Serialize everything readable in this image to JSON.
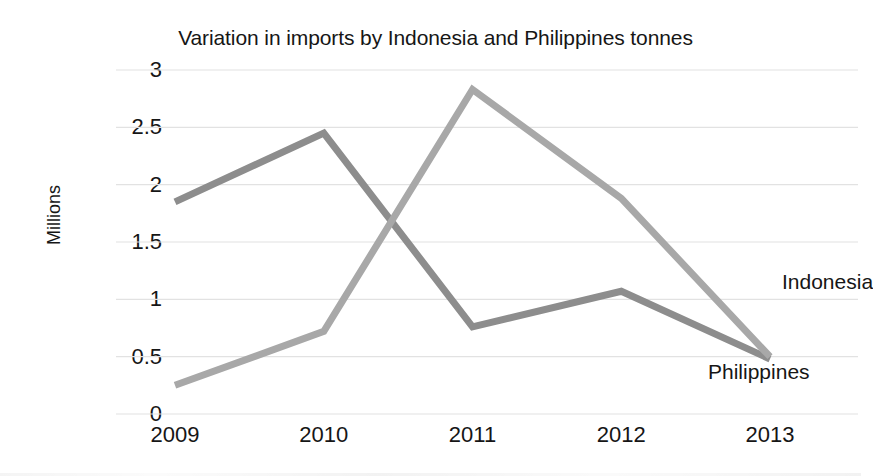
{
  "chart_data": {
    "type": "line",
    "title": "Variation in imports by Indonesia and Philippines tonnes",
    "xlabel": "",
    "ylabel": "Millions",
    "categories": [
      "2009",
      "2010",
      "2011",
      "2012",
      "2013"
    ],
    "y_ticks": [
      "3",
      "2.5",
      "2",
      "1.5",
      "1",
      "0.5",
      "0"
    ],
    "y_tick_values": [
      3,
      2.5,
      2,
      1.5,
      1,
      0.5,
      0
    ],
    "ylim": [
      0,
      3
    ],
    "grid": true,
    "legend_position": "direct-labels-right",
    "series": [
      {
        "name": "Indonesia",
        "color": "#8d8d8d",
        "values": [
          1.85,
          2.45,
          0.76,
          1.07,
          0.48
        ]
      },
      {
        "name": "Philippines",
        "color": "#a8a8a8",
        "values": [
          0.25,
          0.72,
          2.83,
          1.88,
          0.5
        ]
      }
    ],
    "annotations": [
      {
        "text": "Indonesia",
        "x": 2013,
        "y": 1.15
      },
      {
        "text": "Philippines",
        "x": 2013,
        "y": 0.37
      }
    ]
  },
  "colors": {
    "gridline": "#e2e2e2",
    "text": "#161616",
    "background": "#ffffff",
    "series_indonesia": "#8d8d8d",
    "series_philippines": "#a8a8a8"
  }
}
